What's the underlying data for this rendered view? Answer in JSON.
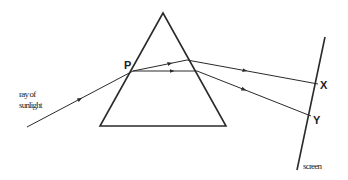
{
  "diagram": {
    "colors": {
      "line": "#2a2a2a",
      "background": "#ffffff"
    },
    "labels": {
      "incident_line1": "ray of",
      "incident_line2": "sunlight",
      "point_p": "P",
      "point_x": "X",
      "point_y": "Y",
      "screen": "screen"
    },
    "prism": {
      "apex": [
        163,
        13
      ],
      "base_left": [
        100,
        126
      ],
      "base_right": [
        226,
        126
      ]
    },
    "incident_ray": {
      "from": [
        27,
        127
      ],
      "to": [
        133,
        71
      ]
    },
    "refracted_rays": [
      {
        "name": "upper",
        "points": [
          [
            133,
            71
          ],
          [
            187,
            60
          ],
          [
            318,
            84
          ]
        ]
      },
      {
        "name": "lower",
        "points": [
          [
            133,
            71
          ],
          [
            197,
            71
          ],
          [
            311,
            116
          ]
        ]
      }
    ],
    "screen_line": {
      "from": [
        325,
        37
      ],
      "to": [
        297,
        170
      ]
    }
  }
}
